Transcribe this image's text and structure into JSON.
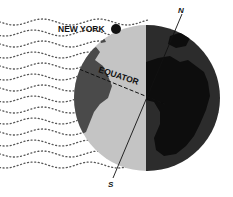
{
  "diagram": {
    "labels": {
      "city": "NEW YORK",
      "equator": "EQUATOR",
      "north": "N",
      "south": "S"
    },
    "colors": {
      "background": "#ffffff",
      "day_ocean": "#c4c4c4",
      "day_land": "#4a4a4a",
      "night_ocean": "#2a2a2a",
      "night_land": "#0d0d0d",
      "city_dot": "#111111",
      "dots": "#555555"
    },
    "globe": {
      "cx": 147,
      "cy": 98,
      "r": 73,
      "terminator_x": 146
    },
    "city_dot": {
      "cx": 116,
      "cy": 29,
      "r": 5
    },
    "axis": {
      "x1": 182,
      "y1": 12,
      "x2": 113,
      "y2": 182
    },
    "wave_rows": 14
  }
}
